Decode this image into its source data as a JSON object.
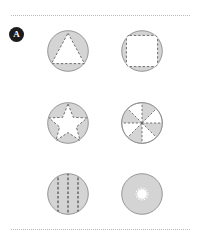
{
  "panel": {
    "label": "A",
    "badge_bg": "#1c1c1c",
    "badge_fg": "#ffffff"
  },
  "style": {
    "disk_fill": "#d4d4d4",
    "disk_stroke": "#8d8d8d",
    "cutout_fill": "#ffffff",
    "dash_stroke": "#5e5e5e",
    "rule_color": "#b9b9b9"
  },
  "rules": [
    {
      "name": "top-dotted-rule",
      "y": 15
    },
    {
      "name": "bottom-dotted-rule",
      "y": 229
    }
  ],
  "figures": [
    {
      "id": "fig-triangle",
      "name": "circle-with-triangle-cutout",
      "shape": "triangle",
      "row": 0,
      "col": 0,
      "caption": "Triangle",
      "diameter": 42
    },
    {
      "id": "fig-square",
      "name": "circle-with-rounded-square-cutout",
      "shape": "rounded-square",
      "row": 0,
      "col": 1,
      "caption": "Rounded square",
      "diameter": 42
    },
    {
      "id": "fig-star",
      "name": "circle-with-star-cutout",
      "shape": "five-point-star",
      "row": 1,
      "col": 0,
      "caption": "Five-pointed star",
      "diameter": 42
    },
    {
      "id": "fig-pinwheel",
      "name": "circle-with-eight-segment-pinwheel",
      "shape": "pinwheel",
      "row": 1,
      "col": 1,
      "caption": "Eight alternating sectors",
      "segments": 8,
      "diameter": 42
    },
    {
      "id": "fig-stripes",
      "name": "circle-with-vertical-dashed-stripes",
      "shape": "vertical-stripes",
      "row": 2,
      "col": 0,
      "caption": "Three vertical dashed lines",
      "lines": 3,
      "diameter": 42
    },
    {
      "id": "fig-hole",
      "name": "circle-with-scalloped-center-hole",
      "shape": "scalloped-hole",
      "row": 2,
      "col": 1,
      "caption": "Scalloped central hole",
      "diameter": 42
    }
  ]
}
